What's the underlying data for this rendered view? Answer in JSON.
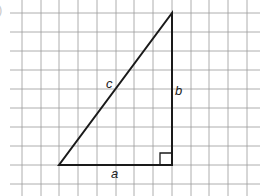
{
  "figure": {
    "part_label_clipped": ")",
    "grid": {
      "color": "#9a9a9a",
      "vertical_x": [
        22,
        41,
        59,
        78,
        97,
        116,
        134,
        153,
        172,
        191,
        209,
        228,
        247
      ],
      "horizontal_y": [
        13,
        32,
        51,
        70,
        89,
        108,
        127,
        146,
        165,
        184
      ],
      "h_start_x": 10,
      "h_end_x": 260,
      "v_start_y": 0,
      "v_end_y": 196
    },
    "triangle": {
      "stroke": "#1a1a1a",
      "vertices": {
        "left": [
          59,
          165
        ],
        "right_angle": [
          172,
          165
        ],
        "top": [
          172,
          13
        ]
      },
      "right_angle_marker_size": 12
    },
    "labels": {
      "hypotenuse": "c",
      "vertical_leg": "b",
      "horizontal_leg": "a"
    }
  }
}
